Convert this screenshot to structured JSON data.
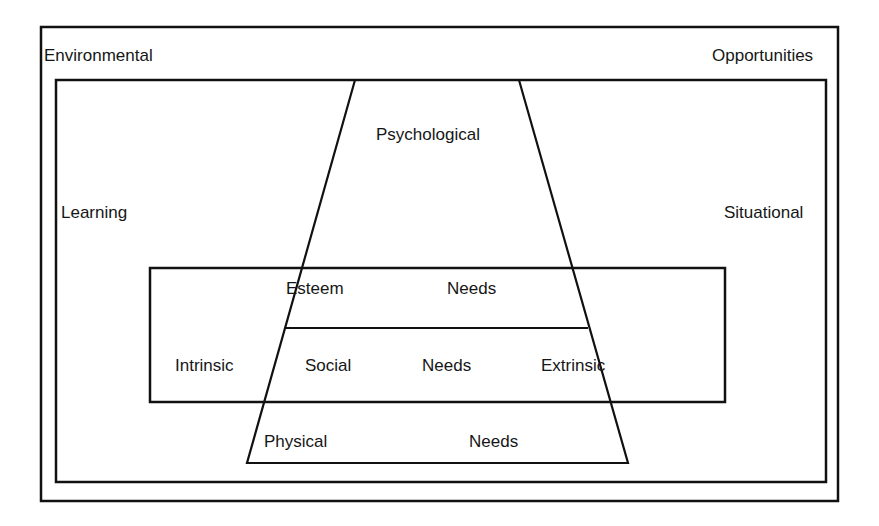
{
  "diagram": {
    "outer_frame": {
      "left_label": "Environmental",
      "right_label": "Opportunities"
    },
    "inner_frame": {
      "left_label": "Learning",
      "right_label": "Situational"
    },
    "middle_band": {
      "left_label": "Intrinsic",
      "right_label": "Extrinsic"
    },
    "pyramid": {
      "top": "Psychological",
      "levels": [
        {
          "left": "Esteem",
          "right": "Needs"
        },
        {
          "left": "Social",
          "right": "Needs"
        },
        {
          "left": "Physical",
          "right": "Needs"
        }
      ]
    },
    "colors": {
      "line": "#111111",
      "background": "#ffffff"
    }
  }
}
